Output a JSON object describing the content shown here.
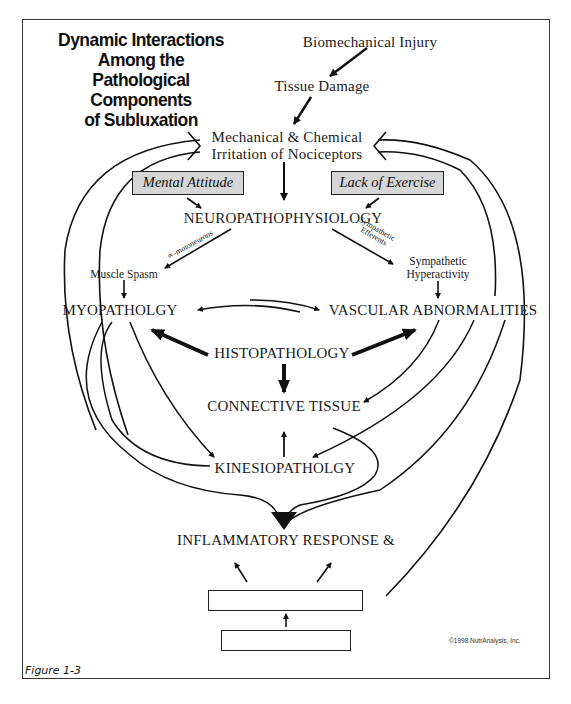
{
  "title": {
    "line1": "Dynamic Interactions",
    "line2": "Among the",
    "line3": "Pathological Components",
    "line4": "of Subluxation"
  },
  "nodes": {
    "biomechanical_injury": "Biomechanical Injury",
    "tissue_damage": "Tissue Damage",
    "irritation_line1": "Mechanical & Chemical",
    "irritation_line2": "Irritation of Nociceptors",
    "mental_attitude": "Mental Attitude",
    "lack_of_exercise": "Lack of Exercise",
    "neuropathophysiology": "NEUROPATHOPHYSIOLOGY",
    "alpha_motoneurons": "∝-motoneurons",
    "sympathetic_efferents_line1": "Sympathetic",
    "sympathetic_efferents_line2": "Efferents",
    "muscle_spasm": "Muscle Spasm",
    "sympathetic_hyperactivity_line1": "Sympathetic",
    "sympathetic_hyperactivity_line2": "Hyperactivity",
    "myopathology": "MYOPATHOLGY",
    "vascular_abnormalities": "VASCULAR ABNORMALITIES",
    "histopathology": "HISTOPATHOLOGY",
    "connective_tissue": "CONNECTIVE TISSUE",
    "kinesiopathology": "KINESIOPATHOLGY",
    "inflammatory_response": "INFLAMMATORY RESPONSE &"
  },
  "footer": {
    "copyright": "©1998 NutrAnalysis, Inc.",
    "figure_label": "Figure 1-3"
  },
  "colors": {
    "line": "#111111",
    "shaded_box": "#d6d6d6",
    "frame": "#333333"
  }
}
